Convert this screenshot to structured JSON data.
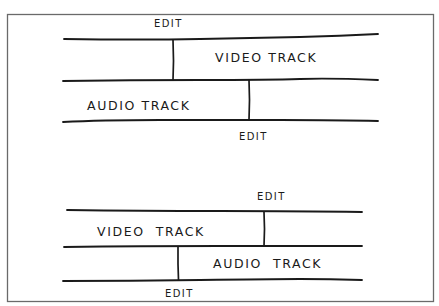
{
  "figure": {
    "frame_color": "#6a6a6a",
    "ink_color": "#1a1a1a",
    "background": "#ffffff"
  },
  "diagram_top": {
    "edit_above_label": "EDIT",
    "video_track_label": "VIDEO TRACK",
    "audio_track_label": "AUDIO TRACK",
    "edit_below_label": "EDIT"
  },
  "diagram_bottom": {
    "edit_above_label": "EDIT",
    "video_track_label": "VIDEO  TRACK",
    "audio_track_label": "AUDIO  TRACK",
    "edit_below_label": "EDIT"
  }
}
